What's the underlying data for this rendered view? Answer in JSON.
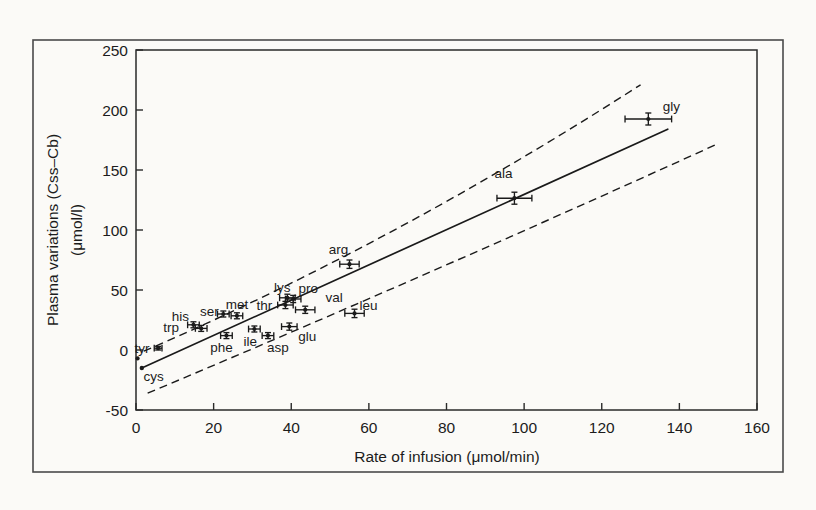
{
  "figure": {
    "background": "#fbfaf7",
    "outer_border_color": "#4a4a4a",
    "axis_color": "#2a2a2a",
    "ink_color": "#1a1a1a"
  },
  "chart_data": {
    "type": "scatter",
    "title": "",
    "xlabel": "Rate of infusion (μmol/min)",
    "ylabel_line1": "Plasma variations (Css–Cb)",
    "ylabel_line2": "(μmol/l)",
    "xlim": [
      0,
      160
    ],
    "ylim": [
      -50,
      250
    ],
    "xticks": [
      0,
      20,
      40,
      60,
      80,
      100,
      120,
      140,
      160
    ],
    "yticks": [
      -50,
      0,
      50,
      100,
      150,
      200,
      250
    ],
    "grid": false,
    "legend": "none",
    "marker_style": "cross-with-error-bars",
    "points": [
      {
        "name": "cys",
        "x": 0.4,
        "y": -7,
        "xerr": 0.3,
        "yerr": 0.8,
        "label_dx": 16,
        "label_dy": 18
      },
      {
        "name": "tyr",
        "x": 5.7,
        "y": 1.5,
        "xerr": 1.0,
        "yerr": 1.5,
        "label_dx": -16,
        "label_dy": 0
      },
      {
        "name": "his",
        "x": 14.8,
        "y": 21,
        "xerr": 1.5,
        "yerr": 2.5,
        "label_dx": -13,
        "label_dy": -8
      },
      {
        "name": "trp",
        "x": 16.8,
        "y": 18,
        "xerr": 1.5,
        "yerr": 2.5,
        "label_dx": -30,
        "label_dy": -1
      },
      {
        "name": "ser",
        "x": 22.5,
        "y": 30,
        "xerr": 1.5,
        "yerr": 2.5,
        "label_dx": -14,
        "label_dy": -3
      },
      {
        "name": "phe",
        "x": 23.3,
        "y": 12,
        "xerr": 1.5,
        "yerr": 2.5,
        "label_dx": -5,
        "label_dy": 12
      },
      {
        "name": "met",
        "x": 26,
        "y": 28.5,
        "xerr": 1.5,
        "yerr": 2.5,
        "label_dx": 0,
        "label_dy": -11
      },
      {
        "name": "ile",
        "x": 30.5,
        "y": 17.5,
        "xerr": 1.5,
        "yerr": 2.5,
        "label_dx": -4,
        "label_dy": 12
      },
      {
        "name": "asp",
        "x": 34,
        "y": 12,
        "xerr": 1.5,
        "yerr": 2.5,
        "label_dx": 10,
        "label_dy": 12
      },
      {
        "name": "thr",
        "x": 38.5,
        "y": 37.5,
        "xerr": 2.0,
        "yerr": 3.0,
        "label_dx": -21,
        "label_dy": 0
      },
      {
        "name": "lys",
        "x": 39,
        "y": 43.5,
        "xerr": 2.0,
        "yerr": 3.0,
        "label_dx": -5,
        "label_dy": -10
      },
      {
        "name": "glu",
        "x": 39.5,
        "y": 19.5,
        "xerr": 2.0,
        "yerr": 3.0,
        "label_dx": 18,
        "label_dy": 10
      },
      {
        "name": "pro",
        "x": 40.5,
        "y": 42.5,
        "xerr": 2.0,
        "yerr": 3.0,
        "label_dx": 15,
        "label_dy": -11
      },
      {
        "name": "val",
        "x": 43.6,
        "y": 33.5,
        "xerr": 2.5,
        "yerr": 3.0,
        "label_dx": 29,
        "label_dy": -12
      },
      {
        "name": "arg",
        "x": 55,
        "y": 71.5,
        "xerr": 2.5,
        "yerr": 3.5,
        "label_dx": -11,
        "label_dy": -15
      },
      {
        "name": "leu",
        "x": 56.3,
        "y": 30.5,
        "xerr": 2.5,
        "yerr": 3.5,
        "label_dx": 14,
        "label_dy": -8
      },
      {
        "name": "ala",
        "x": 97.5,
        "y": 126.5,
        "xerr": 4.5,
        "yerr": 5.0,
        "label_dx": -11,
        "label_dy": -25
      },
      {
        "name": "gly",
        "x": 132,
        "y": 192.5,
        "xerr": 6.0,
        "yerr": 5.0,
        "label_dx": 23,
        "label_dy": -13
      }
    ],
    "regression_line": {
      "style": "solid",
      "x1": 1.5,
      "y1": -15,
      "x2": 137,
      "y2": 184
    },
    "confidence_band": {
      "style": "dashed",
      "upper": {
        "x1": 2,
        "y1": -1,
        "cx": 66,
        "cy": 88,
        "x2": 130,
        "y2": 221
      },
      "lower": {
        "x1": 3,
        "y1": -36,
        "cx": 76.5,
        "cy": 64,
        "x2": 150,
        "y2": 172
      }
    }
  }
}
